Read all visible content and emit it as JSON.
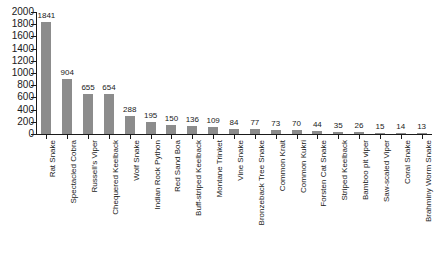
{
  "chart_data": {
    "type": "bar",
    "title": "",
    "subtitle": "",
    "xlabel": "",
    "ylabel": "",
    "ylim": [
      0,
      2000
    ],
    "grid": false,
    "legend": false,
    "legend_position": "none",
    "bar_color": "#8c8c8c",
    "axis_color": "#1a1a1a",
    "value_labels_shown": true,
    "y_ticks": [
      2000,
      1800,
      1600,
      1400,
      1200,
      1000,
      800,
      600,
      400,
      200,
      0
    ],
    "categories": [
      "Rat Snake",
      "Spectacled Cobra",
      "Russell's Viper",
      "Chequered Keelback",
      "Wolf Snake",
      "Indian Rock Python",
      "Red Sand Boa",
      "Buff-striped Keelback",
      "Montane Trinket",
      "Vine Snake",
      "Bronzeback Tree Snake",
      "Common Krait",
      "Common Kukri",
      "Forsten Cat Snake",
      "Striped Keelback",
      "Bamboo pit viper",
      "Saw-scaled Viper",
      "Coral Snake",
      "Brahminy Worm Snake"
    ],
    "values": [
      1841,
      904,
      655,
      654,
      288,
      195,
      150,
      136,
      109,
      84,
      77,
      73,
      70,
      44,
      35,
      26,
      15,
      14,
      13
    ]
  }
}
